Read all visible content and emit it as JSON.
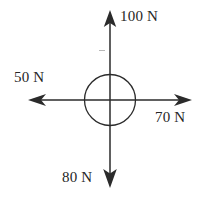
{
  "diagram": {
    "body": {
      "shape": "circle",
      "center_x": 110,
      "center_y": 100,
      "radius": 25
    },
    "stroke_color": "#2b2b2b",
    "background_color": "#ffffff",
    "unit": "N",
    "forces": [
      {
        "id": "up",
        "label": "100 N",
        "magnitude": 100,
        "direction": "up",
        "angle_deg": 90,
        "tip_x": 110,
        "tip_y": 12,
        "label_position": "right-of-arrowhead"
      },
      {
        "id": "left",
        "label": "50 N",
        "magnitude": 50,
        "direction": "left",
        "angle_deg": 180,
        "tip_x": 30,
        "tip_y": 100,
        "label_position": "above-arrowhead"
      },
      {
        "id": "right",
        "label": "70 N",
        "magnitude": 70,
        "direction": "right",
        "angle_deg": 0,
        "tip_x": 190,
        "tip_y": 100,
        "label_position": "below-arrowhead"
      },
      {
        "id": "down",
        "label": "80 N",
        "magnitude": 80,
        "direction": "down",
        "angle_deg": 270,
        "tip_x": 110,
        "tip_y": 186,
        "label_position": "left-of-arrowhead"
      }
    ]
  }
}
